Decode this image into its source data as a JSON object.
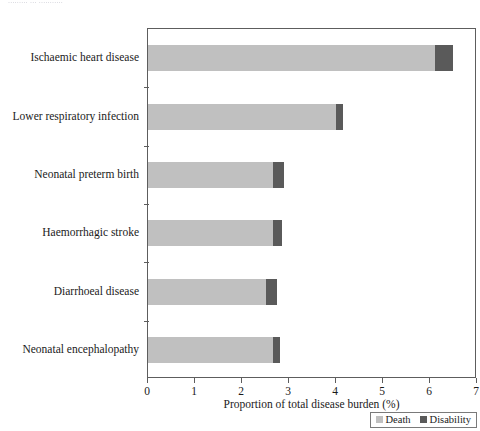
{
  "figure": {
    "top_caption": "......... ... ..........."
  },
  "chart_data": {
    "type": "bar",
    "orientation": "horizontal",
    "stacked": true,
    "title": "",
    "xlabel": "Proportion of total disease burden (%)",
    "ylabel": "",
    "xlim": [
      0,
      7
    ],
    "xticks": [
      0,
      1,
      2,
      3,
      4,
      5,
      6,
      7
    ],
    "xtick_labels": [
      "0",
      "1",
      "2",
      "3",
      "4",
      "5",
      "6",
      "7"
    ],
    "grid": false,
    "legend_position": "lower right",
    "categories": [
      "Ischaemic heart disease",
      "Lower respiratory infection",
      "Neonatal preterm birth",
      "Haemorrhagic stroke",
      "Diarrhoeal disease",
      "Neonatal encephalopathy"
    ],
    "series": [
      {
        "name": "Death",
        "color": "#c0c0c0",
        "values": [
          6.1,
          4.0,
          2.65,
          2.65,
          2.5,
          2.65
        ]
      },
      {
        "name": "Disability",
        "color": "#5a5a5a",
        "values": [
          0.4,
          0.15,
          0.25,
          0.2,
          0.25,
          0.15
        ]
      }
    ],
    "totals": [
      6.5,
      4.15,
      2.9,
      2.85,
      2.75,
      2.8
    ]
  },
  "legend": {
    "items": [
      {
        "label": "Death",
        "color": "#c0c0c0"
      },
      {
        "label": "Disability",
        "color": "#5a5a5a"
      }
    ]
  }
}
